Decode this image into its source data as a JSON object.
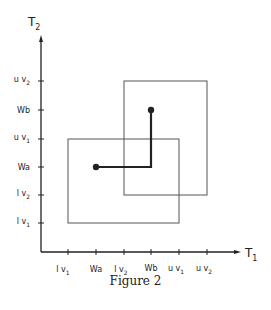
{
  "figure": {
    "caption": "Figure 2",
    "x_axis_label": "T",
    "x_axis_sub": "1",
    "y_axis_label": "T",
    "y_axis_sub": "2",
    "x_ticks": [
      {
        "main": "l v",
        "sub": "1"
      },
      {
        "main": "Wa",
        "sub": ""
      },
      {
        "main": "l v",
        "sub": "2"
      },
      {
        "main": "Wb",
        "sub": ""
      },
      {
        "main": "u v",
        "sub": "1"
      },
      {
        "main": "u v",
        "sub": "2"
      }
    ],
    "y_ticks": [
      {
        "main": "u v",
        "sub": "2"
      },
      {
        "main": "Wb",
        "sub": ""
      },
      {
        "main": "u v",
        "sub": "1"
      },
      {
        "main": "Wa",
        "sub": ""
      },
      {
        "main": "l v",
        "sub": "2"
      },
      {
        "main": "l v",
        "sub": "1"
      }
    ],
    "boxes": [
      {
        "name": "box-v1",
        "x_range": [
          "lv1",
          "uv1"
        ],
        "y_range": [
          "lv1",
          "uv1"
        ]
      },
      {
        "name": "box-v2",
        "x_range": [
          "lv2",
          "uv2"
        ],
        "y_range": [
          "lv2",
          "uv2"
        ]
      }
    ],
    "points": [
      {
        "name": "Wa",
        "x": "Wa",
        "y": "Wa"
      },
      {
        "name": "Wb",
        "x": "Wb",
        "y": "Wb"
      }
    ],
    "colors": {
      "ink": "#222222",
      "box": "#555555"
    }
  }
}
